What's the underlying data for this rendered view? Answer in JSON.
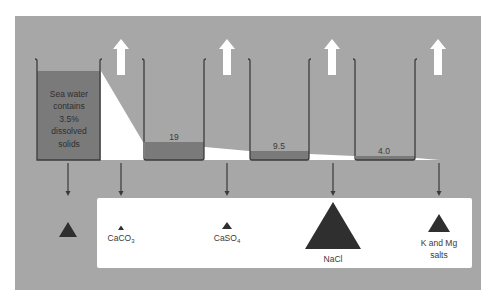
{
  "diagram": {
    "colors": {
      "panel": "#a7a7a7",
      "liquid": "#7a7a7a",
      "beaker_outline": "#3c3c3c",
      "white": "#ffffff",
      "triangle": "#2f2f2f"
    },
    "beakers": [
      {
        "id": 1,
        "label": "Sea water contains 3.5% dissolved solids",
        "label_lines": [
          "Sea water",
          "contains",
          "3.5%",
          "dissolved",
          "solids"
        ]
      },
      {
        "id": 2,
        "level_label": "19"
      },
      {
        "id": 3,
        "level_label": "9.5"
      },
      {
        "id": 4,
        "level_label": "4.0"
      }
    ],
    "evaporation_arrows": 4,
    "precipitates": [
      {
        "name": "",
        "size": "medium",
        "position": "outside"
      },
      {
        "name": "CaCO3",
        "formula_base": "CaCO",
        "formula_sub": "3",
        "size": "tiny"
      },
      {
        "name": "CaSO4",
        "formula_base": "CaSO",
        "formula_sub": "4",
        "size": "small"
      },
      {
        "name": "NaCl",
        "size": "large"
      },
      {
        "name": "K and Mg salts",
        "lines": [
          "K and Mg",
          "salts"
        ],
        "size": "medium"
      }
    ]
  }
}
